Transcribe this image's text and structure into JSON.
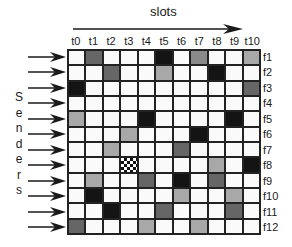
{
  "header": {
    "title": "slots"
  },
  "axis": {
    "side_label": "Senders",
    "side_label_letters": [
      "S",
      "e",
      "n",
      "d",
      "e",
      "r",
      "s"
    ],
    "columns": [
      "t0",
      "t1",
      "t2",
      "t3",
      "t4",
      "t5",
      "t6",
      "t7",
      "t8",
      "t9",
      "t10"
    ],
    "rows": [
      "f1",
      "f2",
      "f3",
      "f4",
      "f5",
      "f6",
      "f7",
      "f8",
      "f9",
      "f10",
      "f11",
      "f12"
    ]
  },
  "grid": {
    "legend_shades": {
      "white": "#fafafa",
      "light": "#a8a8a8",
      "medium": "#8a8a8a",
      "dark": "#666666",
      "black": "#141414",
      "checker": "checkerboard pattern"
    },
    "cells": [
      [
        "white",
        "dark",
        "white",
        "white",
        "white",
        "black",
        "white",
        "medium",
        "white",
        "white",
        "light"
      ],
      [
        "white",
        "white",
        "dark",
        "white",
        "white",
        "light",
        "white",
        "white",
        "black",
        "white",
        "white"
      ],
      [
        "black",
        "white",
        "white",
        "white",
        "white",
        "white",
        "white",
        "white",
        "white",
        "white",
        "dark"
      ],
      [
        "white",
        "white",
        "white",
        "white",
        "white",
        "white",
        "white",
        "white",
        "white",
        "white",
        "white"
      ],
      [
        "light",
        "white",
        "white",
        "white",
        "black",
        "white",
        "white",
        "white",
        "white",
        "black",
        "white"
      ],
      [
        "white",
        "white",
        "white",
        "light",
        "white",
        "white",
        "white",
        "black",
        "white",
        "white",
        "white"
      ],
      [
        "white",
        "white",
        "light",
        "white",
        "white",
        "white",
        "dark",
        "white",
        "white",
        "white",
        "white"
      ],
      [
        "white",
        "white",
        "white",
        "checker",
        "white",
        "white",
        "white",
        "white",
        "light",
        "white",
        "black"
      ],
      [
        "white",
        "light",
        "white",
        "white",
        "dark",
        "white",
        "black",
        "white",
        "dark",
        "white",
        "white"
      ],
      [
        "white",
        "black",
        "white",
        "white",
        "white",
        "white",
        "light",
        "white",
        "white",
        "light",
        "white"
      ],
      [
        "white",
        "white",
        "black",
        "white",
        "white",
        "dark",
        "white",
        "white",
        "white",
        "dark",
        "white"
      ],
      [
        "dark",
        "white",
        "white",
        "white",
        "light",
        "white",
        "white",
        "light",
        "white",
        "white",
        "white"
      ]
    ]
  }
}
